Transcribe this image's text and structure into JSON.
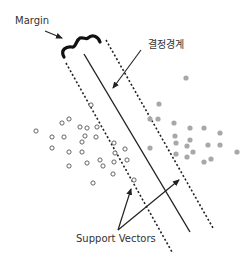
{
  "diagram": {
    "type": "svm-margin",
    "labels": {
      "margin": "Margin",
      "decision_boundary": "결정경계",
      "support_vectors": "Support Vectors"
    },
    "colors": {
      "line": "#222222",
      "open_point_stroke": "#555555",
      "filled_point": "#a8a8a8",
      "text": "#333333"
    },
    "class_a_open_points": [
      [
        36,
        131
      ],
      [
        52,
        137
      ],
      [
        64,
        137
      ],
      [
        62,
        123
      ],
      [
        69,
        119
      ],
      [
        52,
        148
      ],
      [
        69,
        152
      ],
      [
        82,
        152
      ],
      [
        80,
        127
      ],
      [
        87,
        128
      ],
      [
        85,
        136
      ],
      [
        82,
        142
      ],
      [
        97,
        127
      ],
      [
        96,
        137
      ],
      [
        91,
        105
      ],
      [
        114,
        143
      ],
      [
        100,
        160
      ],
      [
        114,
        162
      ],
      [
        69,
        166
      ],
      [
        115,
        153
      ],
      [
        87,
        163
      ],
      [
        125,
        149
      ],
      [
        127,
        160
      ],
      [
        103,
        166
      ],
      [
        113,
        174
      ],
      [
        93,
        183
      ],
      [
        134,
        180
      ]
    ],
    "class_b_filled_points": [
      [
        186,
        78
      ],
      [
        159,
        104
      ],
      [
        150,
        119
      ],
      [
        158,
        119
      ],
      [
        174,
        123
      ],
      [
        190,
        128
      ],
      [
        204,
        128
      ],
      [
        220,
        133
      ],
      [
        175,
        136
      ],
      [
        190,
        140
      ],
      [
        176,
        143
      ],
      [
        187,
        146
      ],
      [
        208,
        145
      ],
      [
        220,
        145
      ],
      [
        237,
        152
      ],
      [
        176,
        154
      ],
      [
        187,
        157
      ],
      [
        193,
        152
      ],
      [
        211,
        159
      ],
      [
        204,
        162
      ],
      [
        150,
        148
      ]
    ]
  }
}
